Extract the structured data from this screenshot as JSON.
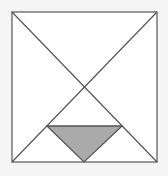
{
  "diagram": {
    "type": "geometry",
    "colors": {
      "background": "#f5f5f5",
      "square_fill": "#ffffff",
      "stroke": "#555555",
      "shaded_fill": "#aaaaaa"
    },
    "square": {
      "x1": 12,
      "y1": 12,
      "x2": 157,
      "y2": 162
    },
    "diagonals": [
      {
        "x1": 12,
        "y1": 12,
        "x2": 157,
        "y2": 162
      },
      {
        "x1": 157,
        "y1": 12,
        "x2": 12,
        "y2": 162
      }
    ],
    "horizontal_segment": {
      "x1": 47,
      "y1": 126,
      "x2": 122,
      "y2": 126
    },
    "shaded_triangle": {
      "points": [
        [
          47,
          126
        ],
        [
          122,
          126
        ],
        [
          84,
          162
        ]
      ]
    }
  }
}
